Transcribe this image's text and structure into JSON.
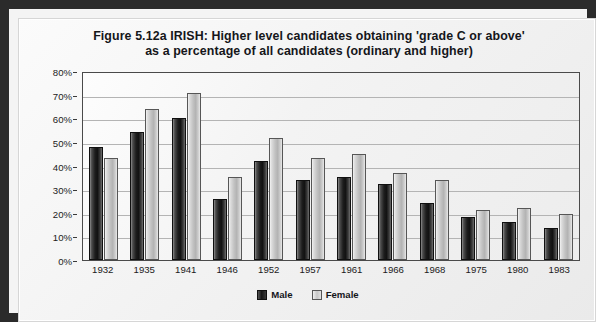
{
  "figure": {
    "label": "Figure 5.12a",
    "title_line_1": "Figure 5.12a   IRISH: Higher level candidates obtaining 'grade C or above'",
    "title_line_2": "as a percentage of all candidates (ordinary and higher)",
    "frame_color": "#2b2b2b",
    "panel_color": "#f4f4f4"
  },
  "chart_data": {
    "type": "bar",
    "title": "Figure 5.12a   IRISH: Higher level candidates obtaining 'grade C or above' as a percentage of all candidates (ordinary and higher)",
    "xlabel": "",
    "ylabel": "",
    "ylim": [
      0,
      80
    ],
    "ytick_labels": [
      "0%",
      "10%",
      "20%",
      "30%",
      "40%",
      "50%",
      "60%",
      "70%",
      "80%"
    ],
    "ytick_values": [
      0,
      10,
      20,
      30,
      40,
      50,
      60,
      70,
      80
    ],
    "grid": true,
    "legend_position": "bottom-center",
    "categories": [
      "1932",
      "1935",
      "1941",
      "1946",
      "1952",
      "1957",
      "1961",
      "1966",
      "1968",
      "1975",
      "1980",
      "1983"
    ],
    "series": [
      {
        "name": "Male",
        "color": "#1d1d1d",
        "values": [
          48,
          54,
          60,
          26,
          42,
          34,
          35,
          32,
          24,
          18,
          16,
          13.5
        ]
      },
      {
        "name": "Female",
        "color": "#c2c2c2",
        "values": [
          43,
          64,
          70.5,
          35,
          51.5,
          43,
          45,
          37,
          34,
          21,
          22,
          19.5
        ]
      }
    ]
  }
}
